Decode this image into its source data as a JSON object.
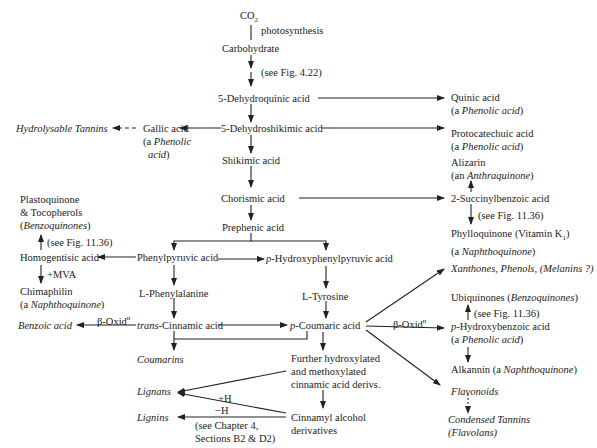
{
  "diagram": {
    "type": "biosynthetic pathway flowchart",
    "nodes": {
      "co2": {
        "label": "CO",
        "sub": "2"
      },
      "photosynthesis": {
        "label": "photosynthesis"
      },
      "carbohydrate": {
        "label": "Carbohydrate"
      },
      "see_fig_422": {
        "label": "(see Fig. 4.22)"
      },
      "dehydroquinic": {
        "label": "5-Dehydroquinic acid"
      },
      "quinic": {
        "label": "Quinic acid",
        "class_pre": "(a ",
        "class_it": "Phenolic acid",
        "class_post": ")"
      },
      "dehydroshikimic": {
        "label": "5-Dehydroshikimic acid"
      },
      "protocatechuic": {
        "label": "Protocatechuic acid",
        "class_pre": "(a ",
        "class_it": "Phenolic acid",
        "class_post": ")"
      },
      "gallic": {
        "label": "Gallic acid",
        "class_pre": "(a ",
        "class_it": "Phenolic",
        "class_line2": "acid",
        "class_post": ")"
      },
      "hydrolysable_tannins": {
        "label": "Hydrolysable Tannins"
      },
      "shikimic": {
        "label": "Shikimic acid"
      },
      "alizarin": {
        "label": "Alizarin",
        "class_pre": "(an ",
        "class_it": "Anthraquinone",
        "class_post": ")"
      },
      "chorismic": {
        "label": "Chorismic acid"
      },
      "succinylbenzoic": {
        "label": "2-Succinylbenzoic acid"
      },
      "see_fig_1136_a": {
        "label": "(see Fig. 11.36)"
      },
      "phylloquinone": {
        "label": "Phylloquinone (Vitamin K",
        "sub": "1",
        "post": ")",
        "class_pre": "(a ",
        "class_it": "Naphthoquinone",
        "class_post": ")"
      },
      "plastoquinone": {
        "line1": "Plastoquinone",
        "line2": "& Tocopherols",
        "line3_pre": "(",
        "line3_it": "Benzoquinones",
        "line3_post": ")"
      },
      "prephenic": {
        "label": "Prephenic acid"
      },
      "see_fig_1136_b": {
        "label": "(see Fig. 11.36)"
      },
      "homogentisic": {
        "label": "Homogentisic acid"
      },
      "phenylpyruvic": {
        "label": "Phenylpyruvic acid"
      },
      "hydroxyphenylpyruvic": {
        "prefix_it": "p",
        "label": "-Hydroxyphenylpyruvic acid"
      },
      "mva": {
        "label": "+MVA"
      },
      "chimaphilin": {
        "label": "Chimaphilin",
        "class_pre": "(a ",
        "class_it": "Naphthoquinone",
        "class_post": ")"
      },
      "phenylalanine": {
        "label": "L-Phenylalanine"
      },
      "tyrosine": {
        "label": "L-Tyrosine"
      },
      "xanthones": {
        "label": "Xanthones, Phenols, (Melanins ?)"
      },
      "ubiquinones": {
        "label": "Ubiquinones (",
        "label_it": "Benzoquinones",
        "label_post": ")"
      },
      "see_fig_1136_c": {
        "label": "(see Fig. 11.36)"
      },
      "benzoic": {
        "label": "Benzoic acid"
      },
      "beta_oxid_left": {
        "label": "β-Oxid",
        "sup": "n"
      },
      "trans_cinnamic": {
        "prefix_it": "trans",
        "label": "-Cinnamic acid"
      },
      "p_coumaric": {
        "prefix_it": "p",
        "label": "-Coumaric acid"
      },
      "beta_oxid_right": {
        "label": "β-Oxid",
        "sup": "n"
      },
      "p_hydroxybenzoic": {
        "prefix_it": "p",
        "label": "-Hydroxybenzoic acid",
        "class_pre": "(a ",
        "class_it": "Phenolic acid",
        "class_post": ")"
      },
      "coumarins": {
        "label": "Coumarins"
      },
      "alkannin": {
        "label": "Alkannin (a ",
        "label_it": "Naphthoquinone",
        "label_post": ")"
      },
      "further_hydroxylated": {
        "line1": "Further hydroxylated",
        "line2": "and methoxylated",
        "line3": "cinnamic acid derivs."
      },
      "lignans": {
        "label": "Lignans"
      },
      "plus_h": {
        "label": "+H"
      },
      "flavonoids": {
        "label": "Flavonoids"
      },
      "lignins": {
        "label": "Lignins"
      },
      "minus_h": {
        "label": "−H"
      },
      "see_chapter4": {
        "line1": "(see Chapter 4,",
        "line2": "Sections B2 & D2)"
      },
      "cinnamyl_alcohol": {
        "line1": "Cinnamyl alcohol",
        "line2": "derivatives"
      },
      "condensed_tannins": {
        "line1": "Condensed Tannins",
        "line2": "(Flavolans)"
      }
    },
    "edges": [
      [
        "CO2",
        "Carbohydrate",
        "photosynthesis"
      ],
      [
        "Carbohydrate",
        "5-Dehydroquinic acid",
        "see Fig. 4.22"
      ],
      [
        "5-Dehydroquinic acid",
        "Quinic acid"
      ],
      [
        "5-Dehydroquinic acid",
        "5-Dehydroshikimic acid"
      ],
      [
        "5-Dehydroshikimic acid",
        "Gallic acid"
      ],
      [
        "Gallic acid",
        "Hydrolysable Tannins",
        "dashed"
      ],
      [
        "5-Dehydroshikimic acid",
        "Protocatechuic acid"
      ],
      [
        "5-Dehydroshikimic acid",
        "Shikimic acid"
      ],
      [
        "Shikimic acid",
        "Chorismic acid"
      ],
      [
        "Chorismic acid",
        "2-Succinylbenzoic acid"
      ],
      [
        "2-Succinylbenzoic acid",
        "Alizarin"
      ],
      [
        "2-Succinylbenzoic acid",
        "Phylloquinone",
        "see Fig. 11.36"
      ],
      [
        "Chorismic acid",
        "Prephenic acid"
      ],
      [
        "Prephenic acid",
        "Phenylpyruvic acid"
      ],
      [
        "Prephenic acid",
        "p-Hydroxyphenylpyruvic acid"
      ],
      [
        "Phenylpyruvic acid",
        "Homogentisic acid"
      ],
      [
        "Phenylpyruvic acid",
        "p-Hydroxyphenylpyruvic acid"
      ],
      [
        "Homogentisic acid",
        "Plastoquinone & Tocopherols",
        "see Fig. 11.36"
      ],
      [
        "Homogentisic acid",
        "Chimaphilin",
        "+MVA"
      ],
      [
        "Phenylpyruvic acid",
        "L-Phenylalanine"
      ],
      [
        "L-Phenylalanine",
        "trans-Cinnamic acid"
      ],
      [
        "trans-Cinnamic acid",
        "Benzoic acid",
        "β-Oxidn"
      ],
      [
        "trans-Cinnamic acid",
        "p-Coumaric acid"
      ],
      [
        "trans-Cinnamic acid",
        "Coumarins"
      ],
      [
        "p-Coumaric acid",
        "Coumarins"
      ],
      [
        "p-Hydroxyphenylpyruvic acid",
        "L-Tyrosine"
      ],
      [
        "L-Tyrosine",
        "p-Coumaric acid"
      ],
      [
        "p-Coumaric acid",
        "Xanthones, Phenols, (Melanins ?)"
      ],
      [
        "p-Coumaric acid",
        "p-Hydroxybenzoic acid",
        "β-Oxidn"
      ],
      [
        "p-Hydroxybenzoic acid",
        "Ubiquinones",
        "see Fig. 11.36"
      ],
      [
        "p-Hydroxybenzoic acid",
        "Alkannin"
      ],
      [
        "p-Coumaric acid",
        "Flavonoids"
      ],
      [
        "Flavonoids",
        "Condensed Tannins",
        "dashed"
      ],
      [
        "p-Coumaric acid",
        "Further hydroxylated and methoxylated cinnamic acid derivs."
      ],
      [
        "Further hydroxylated and methoxylated cinnamic acid derivs.",
        "Lignans"
      ],
      [
        "Further hydroxylated and methoxylated cinnamic acid derivs.",
        "Cinnamyl alcohol derivatives"
      ],
      [
        "Cinnamyl alcohol derivatives",
        "Lignans",
        "+H"
      ],
      [
        "Cinnamyl alcohol derivatives",
        "Lignins",
        "−H"
      ]
    ]
  }
}
